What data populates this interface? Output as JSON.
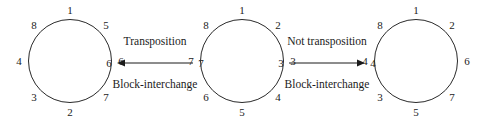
{
  "figure": {
    "background_color": "#ffffff",
    "stroke_color": "#2a2a2a",
    "text_color": "#1b1b1b"
  },
  "circles": [
    {
      "id": "circle-left",
      "nodes": [
        {
          "label": "1",
          "angle_deg": 0
        },
        {
          "label": "5",
          "angle_deg": 45
        },
        {
          "label": "6",
          "angle_deg": 90
        },
        {
          "label": "7",
          "angle_deg": 135
        },
        {
          "label": "2",
          "angle_deg": 180
        },
        {
          "label": "3",
          "angle_deg": 225
        },
        {
          "label": "4",
          "angle_deg": 270
        },
        {
          "label": "8",
          "angle_deg": 315
        }
      ]
    },
    {
      "id": "circle-middle",
      "nodes": [
        {
          "label": "1",
          "angle_deg": 0
        },
        {
          "label": "2",
          "angle_deg": 45
        },
        {
          "label": "3",
          "angle_deg": 90
        },
        {
          "label": "4",
          "angle_deg": 135
        },
        {
          "label": "5",
          "angle_deg": 180
        },
        {
          "label": "6",
          "angle_deg": 225
        },
        {
          "label": "7",
          "angle_deg": 270
        },
        {
          "label": "8",
          "angle_deg": 315
        }
      ]
    },
    {
      "id": "circle-right",
      "nodes": [
        {
          "label": "1",
          "angle_deg": 0
        },
        {
          "label": "2",
          "angle_deg": 45
        },
        {
          "label": "6",
          "angle_deg": 90
        },
        {
          "label": "7",
          "angle_deg": 135
        },
        {
          "label": "5",
          "angle_deg": 180
        },
        {
          "label": "3",
          "angle_deg": 225
        },
        {
          "label": "4",
          "angle_deg": 270
        },
        {
          "label": "8",
          "angle_deg": 315
        }
      ]
    }
  ],
  "transforms": [
    {
      "id": "transform-left",
      "top_caption": "Transposition",
      "bottom_caption": "Block-interchange",
      "direction": "left",
      "source_endpoint": "7",
      "target_endpoint": "6"
    },
    {
      "id": "transform-right",
      "top_caption": "Not transposition",
      "bottom_caption": "Block-interchange",
      "direction": "right",
      "source_endpoint": "3",
      "target_endpoint": "4"
    }
  ]
}
